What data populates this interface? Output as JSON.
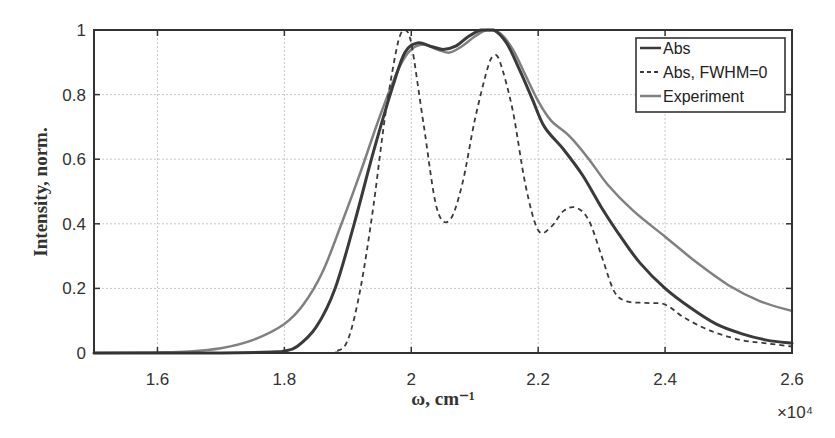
{
  "chart_data": {
    "type": "line",
    "title": "",
    "xlabel": "ω, cm⁻¹",
    "ylabel": "Intensity, norm.",
    "x_multiplier": "×10⁴",
    "xlim": [
      1.5,
      2.6
    ],
    "ylim": [
      0,
      1
    ],
    "grid": true,
    "legend_position": "upper right",
    "x_ticks": [
      "1.6",
      "1.8",
      "2",
      "2.2",
      "2.4",
      "2.6"
    ],
    "x_tick_values": [
      1.6,
      1.8,
      2.0,
      2.2,
      2.4,
      2.6
    ],
    "y_ticks": [
      "0",
      "0.2",
      "0.4",
      "0.6",
      "0.8",
      "1"
    ],
    "y_tick_values": [
      0,
      0.2,
      0.4,
      0.6,
      0.8,
      1.0
    ],
    "series": [
      {
        "name": "Abs",
        "style": "solid",
        "color": "#3a3a3a",
        "width": 3,
        "x": [
          1.5,
          1.7,
          1.78,
          1.8,
          1.82,
          1.85,
          1.88,
          1.91,
          1.94,
          1.97,
          1.99,
          2.01,
          2.03,
          2.05,
          2.07,
          2.09,
          2.11,
          2.13,
          2.15,
          2.17,
          2.19,
          2.21,
          2.24,
          2.27,
          2.3,
          2.33,
          2.36,
          2.4,
          2.44,
          2.48,
          2.52,
          2.56,
          2.6
        ],
        "y": [
          0,
          0,
          0.003,
          0.006,
          0.02,
          0.08,
          0.2,
          0.4,
          0.62,
          0.82,
          0.93,
          0.96,
          0.95,
          0.94,
          0.95,
          0.98,
          1.0,
          1.0,
          0.96,
          0.88,
          0.79,
          0.7,
          0.63,
          0.55,
          0.45,
          0.36,
          0.28,
          0.2,
          0.14,
          0.09,
          0.06,
          0.04,
          0.03
        ]
      },
      {
        "name": "Abs, FWHM=0",
        "style": "dashed",
        "color": "#3a3a3a",
        "width": 1.8,
        "x": [
          1.5,
          1.85,
          1.88,
          1.9,
          1.92,
          1.94,
          1.96,
          1.98,
          1.99,
          2.0,
          2.02,
          2.04,
          2.06,
          2.08,
          2.1,
          2.12,
          2.13,
          2.14,
          2.16,
          2.18,
          2.2,
          2.22,
          2.24,
          2.26,
          2.28,
          2.3,
          2.32,
          2.34,
          2.37,
          2.4,
          2.43,
          2.47,
          2.52,
          2.56,
          2.6
        ],
        "y": [
          0,
          0,
          0.005,
          0.04,
          0.2,
          0.45,
          0.75,
          0.97,
          1.0,
          0.96,
          0.7,
          0.45,
          0.41,
          0.52,
          0.72,
          0.88,
          0.92,
          0.9,
          0.75,
          0.52,
          0.38,
          0.39,
          0.44,
          0.45,
          0.41,
          0.3,
          0.19,
          0.16,
          0.155,
          0.15,
          0.11,
          0.07,
          0.04,
          0.03,
          0.02
        ]
      },
      {
        "name": "Experiment",
        "style": "solid",
        "color": "#808080",
        "width": 2.5,
        "x": [
          1.5,
          1.6,
          1.65,
          1.7,
          1.75,
          1.8,
          1.83,
          1.86,
          1.89,
          1.92,
          1.95,
          1.98,
          2.0,
          2.02,
          2.04,
          2.06,
          2.08,
          2.1,
          2.12,
          2.14,
          2.16,
          2.18,
          2.2,
          2.22,
          2.25,
          2.28,
          2.31,
          2.35,
          2.4,
          2.45,
          2.5,
          2.55,
          2.6
        ],
        "y": [
          0,
          0.002,
          0.005,
          0.015,
          0.04,
          0.09,
          0.15,
          0.25,
          0.4,
          0.56,
          0.73,
          0.88,
          0.94,
          0.955,
          0.94,
          0.93,
          0.95,
          0.98,
          1.0,
          0.99,
          0.94,
          0.86,
          0.78,
          0.72,
          0.67,
          0.6,
          0.52,
          0.44,
          0.36,
          0.28,
          0.21,
          0.16,
          0.13
        ]
      }
    ]
  }
}
